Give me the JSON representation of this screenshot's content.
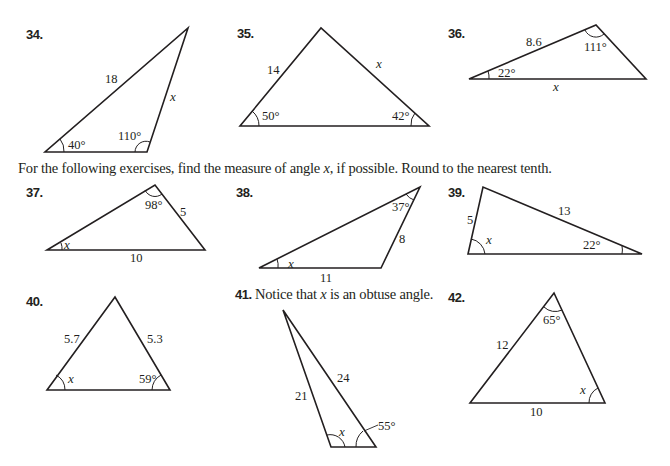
{
  "instruction": {
    "part1": "For the following exercises, find the measure of angle ",
    "var": "x",
    "part2": ", if possible. Round to the nearest tenth."
  },
  "exercises": [
    {
      "number": "34.",
      "side_a": "18",
      "side_x": "x",
      "angle_a": "40°",
      "angle_b": "110°"
    },
    {
      "number": "35.",
      "side_a": "14",
      "side_x": "x",
      "angle_a": "50°",
      "angle_b": "42°"
    },
    {
      "number": "36.",
      "side_a": "8.6",
      "side_x": "x",
      "angle_a": "22°",
      "angle_b": "111°"
    },
    {
      "number": "37.",
      "side_a": "5",
      "side_b": "10",
      "angle_x": "x",
      "angle_a": "98°"
    },
    {
      "number": "38.",
      "side_a": "8",
      "side_b": "11",
      "angle_x": "x",
      "angle_a": "37°"
    },
    {
      "number": "39.",
      "side_a": "5",
      "side_b": "13",
      "angle_x": "x",
      "angle_a": "22°"
    },
    {
      "number": "40.",
      "side_a": "5.7",
      "side_b": "5.3",
      "angle_x": "x",
      "angle_a": "59°"
    },
    {
      "number": "41.",
      "note_part1": "Notice that ",
      "note_var": "x",
      "note_part2": " is an obtuse angle.",
      "side_a": "21",
      "side_b": "24",
      "angle_x": "x",
      "angle_a": "55°"
    },
    {
      "number": "42.",
      "side_a": "12",
      "side_b": "10",
      "angle_x": "x",
      "angle_a": "65°"
    }
  ]
}
